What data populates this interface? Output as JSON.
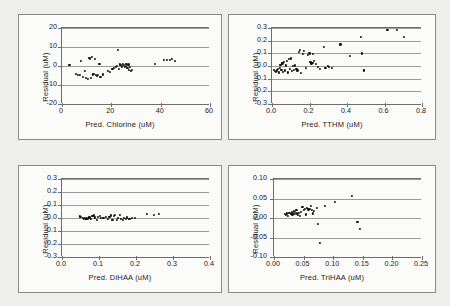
{
  "figure": {
    "background_color": "#eeeeec",
    "panel_background": "#fbfbfa",
    "marker_color": "#111111",
    "grid_color": "#9b9b98",
    "axis_color": "#6d6d6a"
  },
  "chart_data": [
    {
      "type": "scatter",
      "panel": "top-left",
      "title": "",
      "xlabel": "Pred. Chlorine (uM)",
      "ylabel": "Residual (uM)",
      "xlim": [
        0,
        60
      ],
      "ylim": [
        -20,
        20
      ],
      "xticks": [
        "0",
        "20",
        "40",
        "60"
      ],
      "xtick_values": [
        0,
        20,
        40,
        60
      ],
      "yticks": [
        "20",
        "10",
        "0",
        "-10",
        "-20"
      ],
      "ytick_values": [
        20,
        10,
        0,
        -10,
        -20
      ],
      "grid": "horizontal",
      "legend": "none",
      "points": [
        [
          3.0,
          0.6
        ],
        [
          5.8,
          -4.0
        ],
        [
          6.4,
          -4.8
        ],
        [
          7.2,
          -4.6
        ],
        [
          7.6,
          2.8
        ],
        [
          8.4,
          -5.6
        ],
        [
          9.2,
          -2.4
        ],
        [
          9.8,
          -6.2
        ],
        [
          10.4,
          -7.0
        ],
        [
          10.8,
          4.4
        ],
        [
          11.4,
          4.0
        ],
        [
          11.8,
          -6.4
        ],
        [
          12.2,
          5.0
        ],
        [
          12.6,
          -4.4
        ],
        [
          13.0,
          -4.2
        ],
        [
          13.4,
          3.8
        ],
        [
          13.8,
          -4.6
        ],
        [
          14.2,
          -5.4
        ],
        [
          14.6,
          -4.8
        ],
        [
          15.2,
          1.0
        ],
        [
          15.6,
          -5.6
        ],
        [
          16.6,
          -4.4
        ],
        [
          18.6,
          -2.4
        ],
        [
          19.4,
          -3.2
        ],
        [
          20.4,
          -1.6
        ],
        [
          21.2,
          -1.0
        ],
        [
          21.8,
          -0.4
        ],
        [
          22.2,
          0.2
        ],
        [
          22.6,
          8.6
        ],
        [
          23.0,
          -1.4
        ],
        [
          23.6,
          0.8
        ],
        [
          24.0,
          0.4
        ],
        [
          24.4,
          -0.2
        ],
        [
          24.8,
          1.0
        ],
        [
          25.2,
          0.6
        ],
        [
          25.4,
          -0.6
        ],
        [
          25.8,
          1.2
        ],
        [
          26.0,
          0.2
        ],
        [
          26.2,
          1.0
        ],
        [
          26.4,
          -0.8
        ],
        [
          26.6,
          0.4
        ],
        [
          26.8,
          -1.2
        ],
        [
          27.0,
          0.8
        ],
        [
          27.2,
          -2.0
        ],
        [
          27.4,
          -0.4
        ],
        [
          27.8,
          -2.4
        ],
        [
          28.2,
          -2.2
        ],
        [
          37.8,
          1.2
        ],
        [
          41.4,
          3.2
        ],
        [
          42.6,
          3.4
        ],
        [
          43.8,
          3.4
        ],
        [
          44.6,
          3.6
        ],
        [
          45.8,
          2.8
        ]
      ]
    },
    {
      "type": "scatter",
      "panel": "top-right",
      "title": "",
      "xlabel": "Pred. TTHM (uM)",
      "ylabel": "Residual (uM)",
      "xlim": [
        0.0,
        0.8
      ],
      "ylim": [
        -0.3,
        0.3
      ],
      "xticks": [
        "0.0",
        "0.2",
        "0.4",
        "0.6",
        "0.8"
      ],
      "xtick_values": [
        0.0,
        0.2,
        0.4,
        0.6,
        0.8
      ],
      "yticks": [
        "0.3",
        "0.2",
        "0.1",
        "0.0",
        "-0.1",
        "-0.2",
        "-0.3"
      ],
      "ytick_values": [
        0.3,
        0.2,
        0.1,
        0.0,
        -0.1,
        -0.2,
        -0.3
      ],
      "grid": "horizontal",
      "legend": "none",
      "points": [
        [
          0.01,
          -0.03
        ],
        [
          0.015,
          -0.04
        ],
        [
          0.02,
          -0.045
        ],
        [
          0.025,
          -0.035
        ],
        [
          0.03,
          -0.02
        ],
        [
          0.035,
          -0.05
        ],
        [
          0.04,
          -0.015
        ],
        [
          0.045,
          0.01
        ],
        [
          0.05,
          -0.03
        ],
        [
          0.055,
          0.02
        ],
        [
          0.06,
          -0.045
        ],
        [
          0.065,
          0.03
        ],
        [
          0.07,
          -0.035
        ],
        [
          0.075,
          0.005
        ],
        [
          0.08,
          0.04
        ],
        [
          0.085,
          -0.05
        ],
        [
          0.09,
          0.055
        ],
        [
          0.095,
          -0.025
        ],
        [
          0.1,
          0.06
        ],
        [
          0.105,
          -0.04
        ],
        [
          0.11,
          0.0
        ],
        [
          0.115,
          -0.03
        ],
        [
          0.12,
          0.005
        ],
        [
          0.13,
          -0.02
        ],
        [
          0.135,
          -0.035
        ],
        [
          0.145,
          0.11
        ],
        [
          0.15,
          0.125
        ],
        [
          0.155,
          -0.055
        ],
        [
          0.165,
          0.095
        ],
        [
          0.17,
          0.12
        ],
        [
          0.18,
          -0.015
        ],
        [
          0.19,
          0.085
        ],
        [
          0.195,
          0.105
        ],
        [
          0.2,
          0.1
        ],
        [
          0.205,
          0.03
        ],
        [
          0.21,
          0.02
        ],
        [
          0.215,
          0.025
        ],
        [
          0.22,
          0.095
        ],
        [
          0.225,
          0.04
        ],
        [
          0.235,
          0.015
        ],
        [
          0.245,
          -0.01
        ],
        [
          0.255,
          -0.02
        ],
        [
          0.275,
          0.15
        ],
        [
          0.285,
          -0.015
        ],
        [
          0.3,
          0.0
        ],
        [
          0.305,
          -0.01
        ],
        [
          0.32,
          -0.015
        ],
        [
          0.365,
          0.17
        ],
        [
          0.415,
          0.08
        ],
        [
          0.475,
          0.23
        ],
        [
          0.48,
          0.1
        ],
        [
          0.488,
          -0.035
        ],
        [
          0.49,
          -0.03
        ],
        [
          0.615,
          0.288
        ],
        [
          0.665,
          0.285
        ],
        [
          0.705,
          0.232
        ]
      ]
    },
    {
      "type": "scatter",
      "panel": "bottom-left",
      "title": "",
      "xlabel": "Pred. DiHAA (uM)",
      "ylabel": "Residual (uM)",
      "xlim": [
        0.0,
        0.4
      ],
      "ylim": [
        -0.3,
        0.3
      ],
      "xticks": [
        "0.0",
        "0.1",
        "0.2",
        "0.3",
        "0.4"
      ],
      "xtick_values": [
        0.0,
        0.1,
        0.2,
        0.3,
        0.4
      ],
      "yticks": [
        "0.3",
        "0.2",
        "0.1",
        "0.0",
        "-0.1",
        "-0.2",
        "-0.3"
      ],
      "ytick_values": [
        0.3,
        0.2,
        0.1,
        0.0,
        -0.1,
        -0.2,
        -0.3
      ],
      "grid": "horizontal",
      "legend": "none",
      "points": [
        [
          0.048,
          0.012
        ],
        [
          0.052,
          0.006
        ],
        [
          0.056,
          0.002
        ],
        [
          0.06,
          -0.004
        ],
        [
          0.062,
          0.0
        ],
        [
          0.064,
          -0.008
        ],
        [
          0.066,
          -0.006
        ],
        [
          0.068,
          -0.002
        ],
        [
          0.07,
          -0.01
        ],
        [
          0.074,
          0.004
        ],
        [
          0.078,
          -0.006
        ],
        [
          0.082,
          0.014
        ],
        [
          0.086,
          0.02
        ],
        [
          0.09,
          0.004
        ],
        [
          0.094,
          -0.012
        ],
        [
          0.098,
          0.008
        ],
        [
          0.102,
          0.016
        ],
        [
          0.106,
          0.002
        ],
        [
          0.112,
          -0.002
        ],
        [
          0.118,
          0.006
        ],
        [
          0.124,
          -0.01
        ],
        [
          0.128,
          0.01
        ],
        [
          0.132,
          0.02
        ],
        [
          0.136,
          -0.014
        ],
        [
          0.14,
          0.018
        ],
        [
          0.144,
          0.024
        ],
        [
          0.148,
          -0.012
        ],
        [
          0.152,
          0.002
        ],
        [
          0.156,
          0.022
        ],
        [
          0.16,
          -0.008
        ],
        [
          0.164,
          -0.014
        ],
        [
          0.168,
          0.0
        ],
        [
          0.172,
          -0.01
        ],
        [
          0.176,
          0.004
        ],
        [
          0.182,
          -0.008
        ],
        [
          0.188,
          0.002
        ],
        [
          0.196,
          0.0
        ],
        [
          0.23,
          0.03
        ],
        [
          0.248,
          0.026
        ],
        [
          0.262,
          0.032
        ]
      ]
    },
    {
      "type": "scatter",
      "panel": "bottom-right",
      "title": "",
      "xlabel": "Pred. TriHAA (uM)",
      "ylabel": "Residual (uM)",
      "xlim": [
        0.0,
        0.25
      ],
      "ylim": [
        -0.1,
        0.1
      ],
      "xticks": [
        "0.00",
        "0.05",
        "0.10",
        "0.15",
        "0.20",
        "0.25"
      ],
      "xtick_values": [
        0.0,
        0.05,
        0.1,
        0.15,
        0.2,
        0.25
      ],
      "yticks": [
        "0.10",
        "0.05",
        "0.00",
        "-0.05",
        "-0.10"
      ],
      "ytick_values": [
        0.1,
        0.05,
        0.0,
        -0.05,
        -0.1
      ],
      "grid": "horizontal",
      "legend": "none",
      "points": [
        [
          0.018,
          0.01
        ],
        [
          0.02,
          0.008
        ],
        [
          0.022,
          0.012
        ],
        [
          0.024,
          0.006
        ],
        [
          0.026,
          0.014
        ],
        [
          0.028,
          0.01
        ],
        [
          0.03,
          0.016
        ],
        [
          0.031,
          0.009
        ],
        [
          0.032,
          0.013
        ],
        [
          0.034,
          0.018
        ],
        [
          0.035,
          0.011
        ],
        [
          0.036,
          0.015
        ],
        [
          0.038,
          0.02
        ],
        [
          0.039,
          0.012
        ],
        [
          0.04,
          0.008
        ],
        [
          0.042,
          0.014
        ],
        [
          0.044,
          0.006
        ],
        [
          0.046,
          0.016
        ],
        [
          0.048,
          0.028
        ],
        [
          0.05,
          0.02
        ],
        [
          0.052,
          0.024
        ],
        [
          0.054,
          0.009
        ],
        [
          0.056,
          0.026
        ],
        [
          0.058,
          0.022
        ],
        [
          0.06,
          0.024
        ],
        [
          0.062,
          0.03
        ],
        [
          0.064,
          0.021
        ],
        [
          0.066,
          0.012
        ],
        [
          0.068,
          0.018
        ],
        [
          0.072,
          0.026
        ],
        [
          0.074,
          -0.016
        ],
        [
          0.078,
          -0.064
        ],
        [
          0.086,
          0.031
        ],
        [
          0.103,
          0.041
        ],
        [
          0.131,
          0.056
        ],
        [
          0.141,
          -0.009
        ],
        [
          0.145,
          -0.027
        ]
      ]
    }
  ]
}
